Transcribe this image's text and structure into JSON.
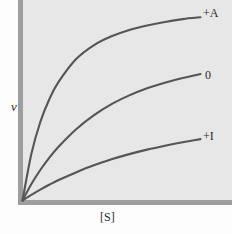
{
  "figure": {
    "background_color": "#fdfdfd",
    "plot_background_color": "#e7e7e7",
    "axis_color": "#9e9e9e",
    "curve_color": "#555555"
  },
  "axes": {
    "y_label": "v",
    "x_label": "[S]"
  },
  "curve_labels": {
    "activator": "+A",
    "control": "0",
    "inhibitor": "+I"
  },
  "chart_data": {
    "type": "line",
    "title": "",
    "subtitle": "",
    "xlabel": "[S]",
    "ylabel": "v",
    "grid": false,
    "legend_position": "right-of-curve-end",
    "xlim": [
      0,
      1
    ],
    "ylim": [
      0,
      1
    ],
    "x_tick_labels": [],
    "y_tick_labels": [],
    "annotations": [
      "+A",
      "0",
      "+I"
    ],
    "series": [
      {
        "name": "+A",
        "description": "saturation curve with activator present; highest Vmax",
        "vmax_relative": 1.0,
        "x": [
          0.0,
          0.05,
          0.1,
          0.15,
          0.2,
          0.3,
          0.4,
          0.5,
          0.6,
          0.7,
          0.8,
          0.9,
          1.0
        ],
        "y": [
          0.0,
          0.25,
          0.42,
          0.54,
          0.63,
          0.755,
          0.83,
          0.878,
          0.912,
          0.936,
          0.955,
          0.97,
          0.98
        ]
      },
      {
        "name": "0",
        "description": "saturation curve with no modifier; intermediate Vmax",
        "vmax_relative": 0.69,
        "x": [
          0.0,
          0.05,
          0.1,
          0.15,
          0.2,
          0.3,
          0.4,
          0.5,
          0.6,
          0.7,
          0.8,
          0.9,
          1.0
        ],
        "y": [
          0.0,
          0.088,
          0.163,
          0.228,
          0.285,
          0.38,
          0.455,
          0.515,
          0.562,
          0.6,
          0.63,
          0.655,
          0.676
        ]
      },
      {
        "name": "+I",
        "description": "saturation curve with inhibitor present; lowest Vmax",
        "vmax_relative": 0.37,
        "x": [
          0.0,
          0.05,
          0.1,
          0.15,
          0.2,
          0.3,
          0.4,
          0.5,
          0.6,
          0.7,
          0.8,
          0.9,
          1.0
        ],
        "y": [
          0.0,
          0.03,
          0.058,
          0.084,
          0.108,
          0.15,
          0.188,
          0.22,
          0.248,
          0.272,
          0.293,
          0.312,
          0.328
        ]
      }
    ]
  }
}
